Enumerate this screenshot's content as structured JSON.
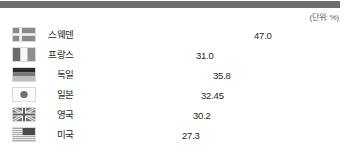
{
  "chart_data": {
    "type": "bar",
    "title": "",
    "subtitle": "",
    "unit_caption": "(단위: %)",
    "xlabel": "",
    "ylabel": "",
    "orientation": "horizontal",
    "grid": false,
    "legend": "none",
    "xlim": [
      0,
      50
    ],
    "categories": [
      "스웨덴",
      "프랑스",
      "독일",
      "일본",
      "영국",
      "미국"
    ],
    "values": [
      47.0,
      31.0,
      35.8,
      32.45,
      30.2,
      27.3
    ],
    "value_labels": [
      "47.0",
      "31.0",
      "35.8",
      "32.45",
      "30.2",
      "27.3"
    ],
    "bar_color": "#b5b5b5",
    "rule_color": "#6e6e6e",
    "text_color": "#231f20",
    "rows": [
      {
        "country": "스웨덴",
        "flag": "flag-sweden-icon",
        "value": 47.0,
        "value_label": "47.0"
      },
      {
        "country": "프랑스",
        "flag": "flag-france-icon",
        "value": 31.0,
        "value_label": "31.0"
      },
      {
        "country": "독일",
        "flag": "flag-germany-icon",
        "value": 35.8,
        "value_label": "35.8"
      },
      {
        "country": "일본",
        "flag": "flag-japan-icon",
        "value": 32.45,
        "value_label": "32.45"
      },
      {
        "country": "영국",
        "flag": "flag-uk-icon",
        "value": 30.2,
        "value_label": "30.2"
      },
      {
        "country": "미국",
        "flag": "flag-usa-icon",
        "value": 27.3,
        "value_label": "27.3"
      }
    ]
  }
}
